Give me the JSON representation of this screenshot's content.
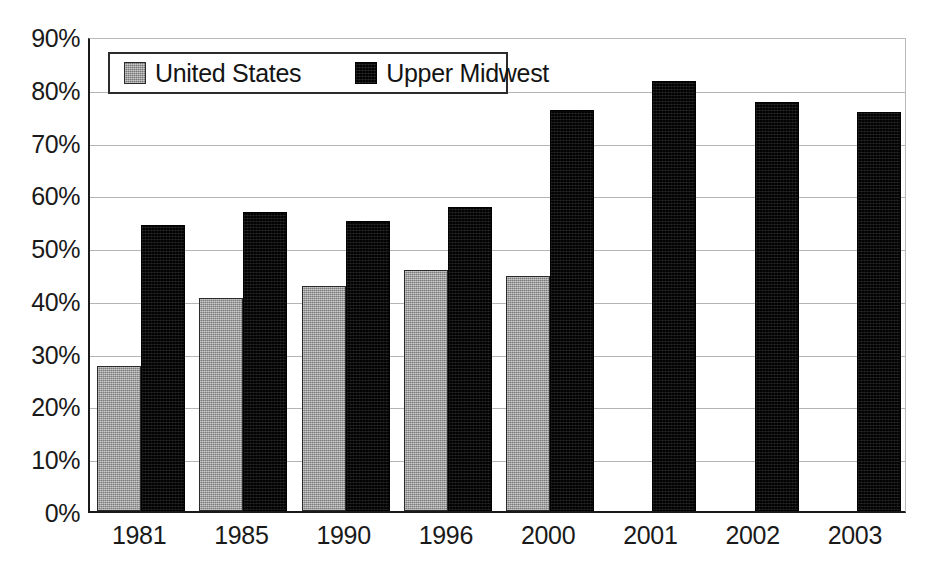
{
  "chart_data": {
    "type": "bar",
    "title": "",
    "xlabel": "",
    "ylabel": "",
    "categories": [
      "1981",
      "1985",
      "1990",
      "1996",
      "2000",
      "2001",
      "2002",
      "2003"
    ],
    "series": [
      {
        "name": "United States",
        "color": "#9a9a9a",
        "values": [
          27.4,
          40.3,
          42.6,
          45.6,
          44.5,
          null,
          null,
          null
        ]
      },
      {
        "name": "Upper Midwest",
        "color": "#0d0d0d",
        "values": [
          54.2,
          56.7,
          54.9,
          57.6,
          76.0,
          81.4,
          77.4,
          75.6
        ]
      }
    ],
    "ylim": [
      0,
      90
    ],
    "ytick_labels": [
      "0%",
      "10%",
      "20%",
      "30%",
      "40%",
      "50%",
      "60%",
      "70%",
      "80%",
      "90%"
    ],
    "ytick_values": [
      0,
      10,
      20,
      30,
      40,
      50,
      60,
      70,
      80,
      90
    ],
    "grid": true,
    "legend_position": "top-left",
    "value_suffix": "%"
  },
  "legend": {
    "entries": [
      {
        "label": "United States",
        "swatch": "us"
      },
      {
        "label": "Upper Midwest",
        "swatch": "um"
      }
    ]
  }
}
